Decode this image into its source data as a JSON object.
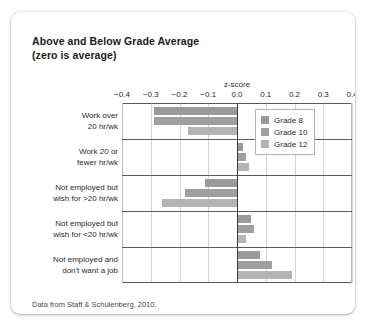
{
  "title": {
    "line1": "Above and Below Grade Average",
    "line2": "(zero is average)"
  },
  "footer": "Data from Staff & Schulenberg, 2010.",
  "legend": {
    "position": "top-right-inside",
    "items": [
      {
        "label": "Grade 8",
        "color": "#9a9a9a"
      },
      {
        "label": "Grade 10",
        "color": "#9f9f9f"
      },
      {
        "label": "Grade 12",
        "color": "#b4b4b4"
      }
    ]
  },
  "chart_data": {
    "type": "bar",
    "orientation": "horizontal",
    "title": "Above and Below Grade Average (zero is average)",
    "xlabel": "z-score",
    "ylabel": "",
    "xlim": [
      -0.4,
      0.4
    ],
    "xticks": [
      -0.4,
      -0.3,
      -0.2,
      -0.1,
      0.0,
      0.1,
      0.2,
      0.3,
      0.4
    ],
    "xticklabels": [
      "−0.4",
      "−0.3",
      "−0.2",
      "−0.1",
      "0.0",
      "0.1",
      "0.2",
      "0.3",
      "0.4"
    ],
    "grid": true,
    "zero_line": 0.0,
    "categories": [
      "Work over 20 hr/wk",
      "Work 20 or fewer hr/wk",
      "Not employed but wish for >20 hr/wk",
      "Not employed but wish for <20 hr/wk",
      "Not employed and don't want a job"
    ],
    "category_lines": [
      [
        "Work over",
        "20 hr/wk"
      ],
      [
        "Work 20 or",
        "fewer hr/wk"
      ],
      [
        "Not employed but",
        "wish for >20 hr/wk"
      ],
      [
        "Not employed but",
        "wish for <20 hr/wk"
      ],
      [
        "Not employed and",
        "don't want a job"
      ]
    ],
    "series": [
      {
        "name": "Grade 8",
        "color": "#9a9a9a",
        "values": [
          -0.29,
          0.02,
          -0.11,
          0.05,
          0.08
        ]
      },
      {
        "name": "Grade 10",
        "color": "#9f9f9f",
        "values": [
          -0.29,
          0.03,
          -0.18,
          0.06,
          0.12
        ]
      },
      {
        "name": "Grade 12",
        "color": "#b4b4b4",
        "values": [
          -0.17,
          0.04,
          -0.26,
          0.03,
          0.19
        ]
      }
    ]
  }
}
